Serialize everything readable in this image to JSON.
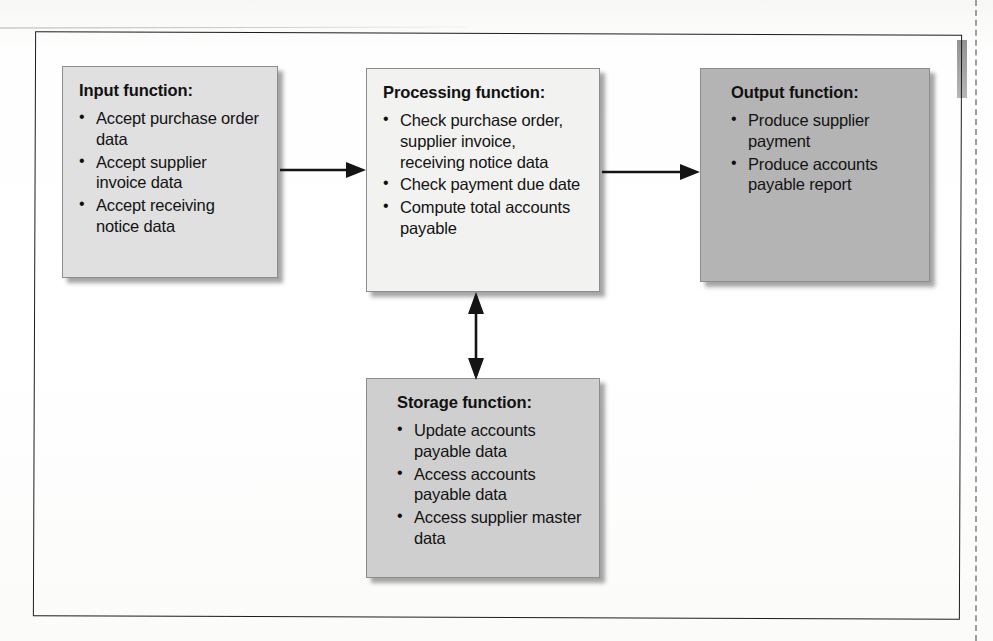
{
  "figure": {
    "top_partial_text": "·· ··  ·",
    "frame_color": "#1d1d1d",
    "background_color": "#ffffff"
  },
  "boxes": [
    {
      "id": "input",
      "title": "Input function:",
      "fill": "#e0e0e0",
      "items": [
        "Accept purchase order data",
        "Accept supplier invoice data",
        "Accept receiving notice data"
      ]
    },
    {
      "id": "processing",
      "title": "Processing function:",
      "fill": "#f2f2f0",
      "items": [
        "Check purchase order, supplier invoice, receiving notice data",
        "Check payment due date",
        "Compute total accounts payable"
      ]
    },
    {
      "id": "output",
      "title": "Output function:",
      "fill": "#b4b4b4",
      "items": [
        "Produce supplier payment",
        "Produce accounts payable report"
      ]
    },
    {
      "id": "storage",
      "title": "Storage function:",
      "fill": "#cfcfcf",
      "items": [
        "Update accounts payable data",
        "Access accounts payable data",
        "Access supplier master data"
      ]
    }
  ],
  "connectors": [
    {
      "id": "input-to-processing",
      "from": "input",
      "to": "processing",
      "style": "single-arrow",
      "direction": "right"
    },
    {
      "id": "processing-to-output",
      "from": "processing",
      "to": "output",
      "style": "single-arrow",
      "direction": "right"
    },
    {
      "id": "processing-to-storage",
      "from": "processing",
      "to": "storage",
      "style": "double-arrow",
      "direction": "vertical"
    }
  ]
}
